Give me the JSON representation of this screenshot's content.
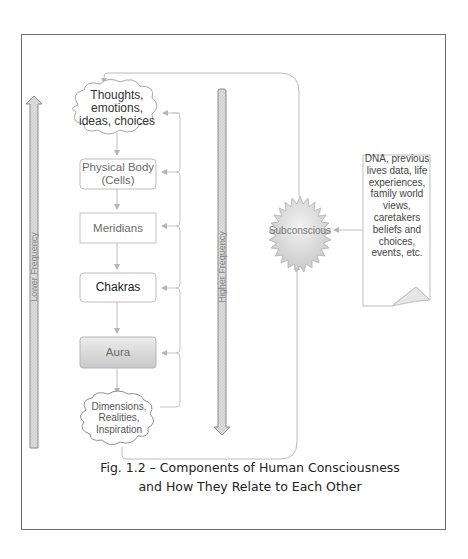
{
  "figure": {
    "caption_line1": "Fig. 1.2 – Components of Human Consciousness",
    "caption_line2": "and How They Relate to Each Other"
  },
  "axes": {
    "left_arrow": {
      "label": "Lower Frequency",
      "direction": "up"
    },
    "right_arrow": {
      "label": "Higher Frequency",
      "direction": "down"
    }
  },
  "nodes": {
    "thoughts": {
      "label": "Thoughts, emotions, ideas, choices",
      "shape": "cloud"
    },
    "physical_body": {
      "label": "Physical Body (Cells)",
      "shape": "rounded-box"
    },
    "meridians": {
      "label": "Meridians",
      "shape": "box"
    },
    "chakras": {
      "label": "Chakras",
      "shape": "rounded-box"
    },
    "aura": {
      "label": "Aura",
      "shape": "shaded-box"
    },
    "dimensions": {
      "label": "Dimensions, Realities, Inspiration",
      "shape": "cloud"
    },
    "subconscious": {
      "label": "Subconscious",
      "shape": "starburst"
    },
    "influences_note": {
      "label": "DNA, previous lives data, life experiences, family world views, caretakers beliefs and choices, events, etc.",
      "shape": "folded-note"
    }
  },
  "colors": {
    "frame": "#6e6e6e",
    "connector": "#bdbdbd",
    "arrow_fill": "#d9d9d9",
    "arrow_stroke": "#8a8a8a",
    "aura_fill": "#cfcfcf"
  }
}
